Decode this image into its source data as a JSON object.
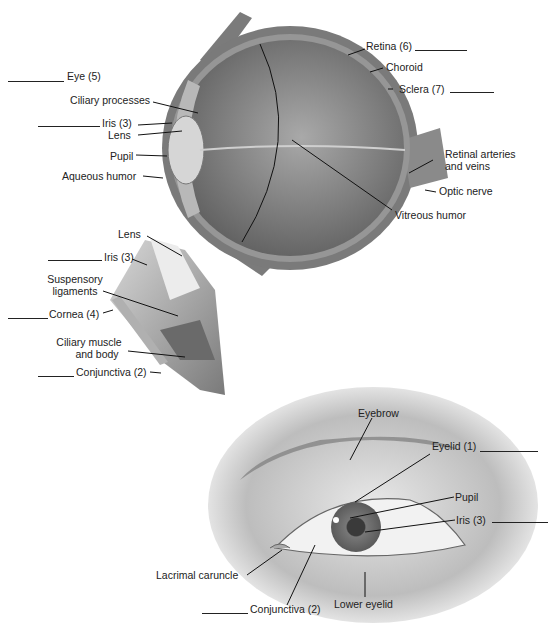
{
  "diagram": {
    "sagittal_section": {
      "labels": {
        "eye": "Eye (5)",
        "ciliary_processes": "Ciliary processes",
        "iris": "Iris (3)",
        "lens": "Lens",
        "pupil": "Pupil",
        "aqueous_humor": "Aqueous humor",
        "retina": "Retina (6)",
        "choroid": "Choroid",
        "sclera": "Sclera (7)",
        "retinal_arteries_1": "Retinal arteries",
        "retinal_arteries_2": "and veins",
        "optic_nerve": "Optic nerve",
        "vitreous_humor": "Vitreous humor"
      }
    },
    "detail_section": {
      "labels": {
        "lens": "Lens",
        "iris": "Iris (3)",
        "suspensory_1": "Suspensory",
        "suspensory_2": "ligaments",
        "cornea": "Cornea (4)",
        "ciliary_muscle_1": "Ciliary muscle",
        "ciliary_muscle_2": "and body",
        "conjunctiva": "Conjunctiva (2)"
      }
    },
    "external_view": {
      "labels": {
        "eyebrow": "Eyebrow",
        "eyelid": "Eyelid (1)",
        "pupil": "Pupil",
        "iris": "Iris (3)",
        "lacrimal_caruncle": "Lacrimal caruncle",
        "conjunctiva": "Conjunctiva (2)",
        "lower_eyelid": "Lower eyelid"
      }
    },
    "colors": {
      "tissue_dark": "#6e6e6e",
      "tissue_mid": "#8e8e8e",
      "tissue_light": "#c8c8c8",
      "line": "#111111"
    }
  }
}
